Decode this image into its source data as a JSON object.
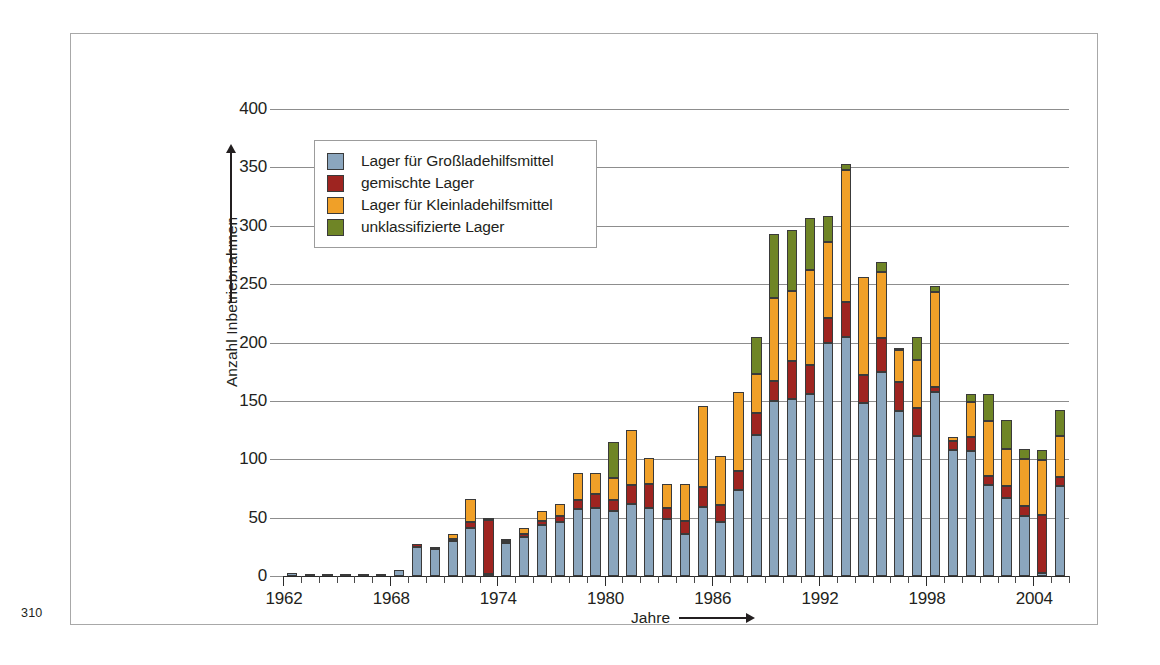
{
  "page": {
    "number": "310"
  },
  "chart_data": {
    "type": "bar",
    "stacked": true,
    "title": "",
    "xlabel": "Jahre",
    "ylabel": "Anzahl Inbetriebnahmen",
    "ylim": [
      0,
      400
    ],
    "ytick_step": 50,
    "yticks": [
      "0",
      "50",
      "100",
      "150",
      "200",
      "250",
      "300",
      "350",
      "400"
    ],
    "grid": true,
    "legend_position": "upper-left-inside",
    "xticks_labeled": [
      "1962",
      "1968",
      "1974",
      "1980",
      "1986",
      "1992",
      "1998",
      "2004"
    ],
    "categories": [
      "1962",
      "1963",
      "1964",
      "1965",
      "1966",
      "1967",
      "1968",
      "1969",
      "1970",
      "1971",
      "1972",
      "1973",
      "1974",
      "1975",
      "1976",
      "1977",
      "1978",
      "1979",
      "1980",
      "1981",
      "1982",
      "1983",
      "1984",
      "1985",
      "1986",
      "1987",
      "1988",
      "1989",
      "1990",
      "1991",
      "1992",
      "1993",
      "1994",
      "1995",
      "1996",
      "1997",
      "1998",
      "1999",
      "2000",
      "2001",
      "2002",
      "2003",
      "2004",
      "2005"
    ],
    "series": [
      {
        "name": "Lager für Großladehilfsmittel",
        "color": "#8ba6be",
        "values": [
          3,
          1,
          1,
          1,
          1,
          2,
          5,
          25,
          23,
          30,
          41,
          2,
          28,
          33,
          44,
          46,
          57,
          58,
          56,
          62,
          58,
          49,
          36,
          59,
          46,
          74,
          121,
          150,
          152,
          156,
          200,
          205,
          148,
          175,
          141,
          120,
          158,
          108,
          107,
          78,
          67,
          51,
          3,
          77
        ]
      },
      {
        "name": "gemischte Lager",
        "color": "#9e2420",
        "values": [
          0,
          0,
          0,
          0,
          0,
          0,
          0,
          2,
          1,
          2,
          5,
          46,
          2,
          3,
          3,
          5,
          8,
          12,
          9,
          16,
          21,
          9,
          11,
          17,
          15,
          16,
          19,
          17,
          32,
          25,
          21,
          30,
          24,
          29,
          25,
          24,
          4,
          8,
          12,
          8,
          10,
          9,
          49,
          8
        ]
      },
      {
        "name": "Lager für Kleinladehilfsmittel",
        "color": "#f0a028",
        "values": [
          0,
          0,
          0,
          0,
          0,
          0,
          0,
          0,
          0,
          4,
          20,
          1,
          1,
          5,
          9,
          11,
          23,
          18,
          19,
          47,
          22,
          21,
          32,
          70,
          42,
          68,
          33,
          71,
          60,
          81,
          65,
          113,
          84,
          56,
          28,
          41,
          81,
          3,
          30,
          47,
          32,
          40,
          47,
          35
        ]
      },
      {
        "name": "unklassifizierte Lager",
        "color": "#6f8526",
        "values": [
          0,
          0,
          0,
          0,
          0,
          0,
          0,
          0,
          0,
          0,
          0,
          0,
          0,
          0,
          0,
          0,
          0,
          0,
          31,
          0,
          0,
          0,
          0,
          0,
          0,
          0,
          32,
          55,
          52,
          45,
          22,
          5,
          0,
          9,
          1,
          20,
          5,
          0,
          7,
          23,
          25,
          9,
          9,
          22
        ]
      }
    ]
  },
  "legend": {
    "items": [
      {
        "label": "Lager für Großladehilfsmittel",
        "color": "#8ba6be",
        "class": "blue"
      },
      {
        "label": "gemischte Lager",
        "color": "#9e2420",
        "class": "red"
      },
      {
        "label": "Lager für Kleinladehilfsmittel",
        "color": "#f0a028",
        "class": "orange"
      },
      {
        "label": "unklassifizierte Lager",
        "color": "#6f8526",
        "class": "green"
      }
    ]
  }
}
